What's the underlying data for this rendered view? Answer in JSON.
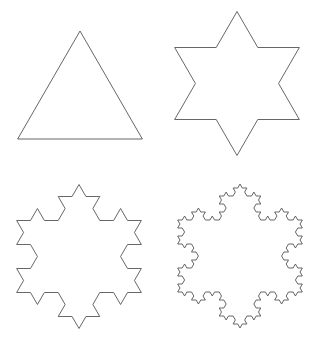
{
  "figure": {
    "background": "#ffffff",
    "stroke_color": "#555555",
    "stroke_width": 0.9,
    "panels": [
      {
        "name": "iteration-0-triangle",
        "iteration": 0,
        "center": [
          80,
          103
        ],
        "radius": 72,
        "rotation_deg": -90
      },
      {
        "name": "iteration-1-star",
        "iteration": 1,
        "center": [
          237,
          83.5
        ],
        "radius": 72,
        "rotation_deg": -90
      },
      {
        "name": "iteration-2-snowflake",
        "iteration": 2,
        "center": [
          79,
          256.5
        ],
        "radius": 72,
        "rotation_deg": -90
      },
      {
        "name": "iteration-3-snowflake",
        "iteration": 3,
        "center": [
          240,
          256
        ],
        "radius": 72,
        "rotation_deg": -90
      }
    ]
  }
}
